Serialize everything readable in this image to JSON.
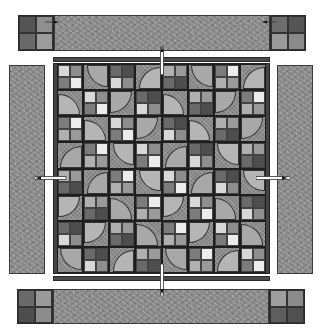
{
  "diagram": {
    "colors": {
      "background": "#ffffff",
      "border_print": "#8a8a8a",
      "sashing": "#4a4a4a",
      "outline": "#2a2a2a",
      "arrow": "#ffffff"
    },
    "top_border": {
      "corner_left": [
        "#555555",
        "#8f8f8f",
        "#6a6a6a",
        "#9c9c9c"
      ],
      "corner_right": [
        "#6d6d6d",
        "#555555",
        "#9a9a9a",
        "#8a8a8a"
      ],
      "direction_arrow": "right"
    },
    "top_right_arrow": "left",
    "bottom_border": {
      "corner_left": [
        "#6a6a6a",
        "#9a9a9a",
        "#4e4e4e",
        "#8c8c8c"
      ],
      "corner_right": [
        "#9e9e9e",
        "#8a8a8a",
        "#5e5e5e",
        "#505050"
      ]
    },
    "side_borders": [
      "left",
      "right"
    ],
    "center_quilt": {
      "rows": 8,
      "cols": 8,
      "block_types": [
        "four-patch",
        "quarter-circle"
      ],
      "arc_colors": [
        "#5f5f5f",
        "#b5b5b5",
        "#6a6a6a",
        "#a8a8a8"
      ],
      "patch_colors": [
        "#d8d8d8",
        "#4e4e4e",
        "#6a6a6a",
        "#9a9a9a",
        "#b0b0b0",
        "#ececec",
        "#7c7c7c",
        "#8e8e8e"
      ]
    },
    "assembly_arrows": [
      {
        "from": "top-border",
        "direction": "down"
      },
      {
        "from": "left-border",
        "direction": "right"
      },
      {
        "from": "right-border",
        "direction": "left"
      },
      {
        "from": "bottom-border",
        "direction": "up"
      }
    ]
  }
}
